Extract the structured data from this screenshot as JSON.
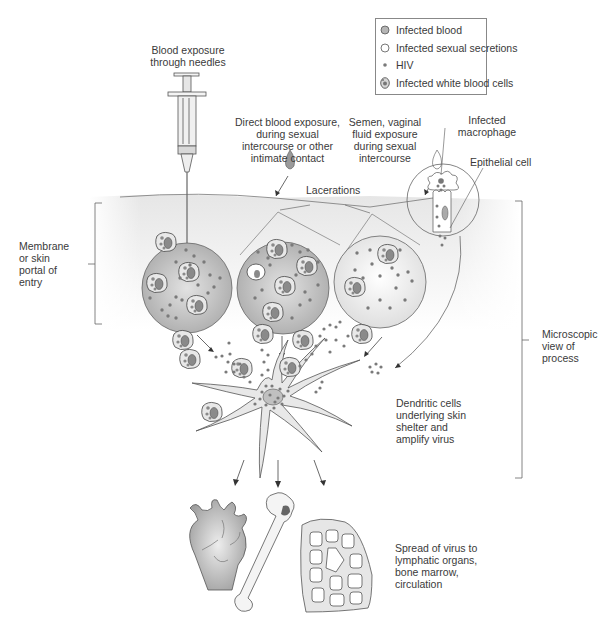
{
  "legend": {
    "items": [
      {
        "icon": "infected-blood-icon",
        "label": "Infected blood",
        "color": "#b5b5b5"
      },
      {
        "icon": "infected-sexual-secretions-icon",
        "label": "Infected sexual secretions",
        "color": "#ffffff"
      },
      {
        "icon": "hiv-icon",
        "label": "HIV",
        "color": "#8a8a8a"
      },
      {
        "icon": "infected-white-blood-cells-icon",
        "label": "Infected white blood cells",
        "color": "#d0d0d0"
      }
    ]
  },
  "labels": {
    "needles": "Blood exposure\nthrough needles",
    "direct_blood": "Direct blood exposure,\nduring sexual\nintercourse or other\nintimate contact",
    "semen": "Semen, vaginal\nfluid exposure\nduring sexual\nintercourse",
    "macrophage": "Infected\nmacrophage",
    "epithelial": "Epithelial cell",
    "lacerations": "Lacerations",
    "membrane": "Membrane\nor skin\nportal of\nentry",
    "microscopic": "Microscopic\nview of\nprocess",
    "dendritic": "Dendritic cells\nunderlying skin\nshelter and\namplify virus",
    "spread": "Spread of virus to\nlymphatic organs,\nbone marrow,\ncirculation"
  },
  "colors": {
    "skin_band": "#ececec",
    "circle_fill": "#c4c4c4",
    "line": "#555555",
    "virus": "#7a7a7a"
  }
}
